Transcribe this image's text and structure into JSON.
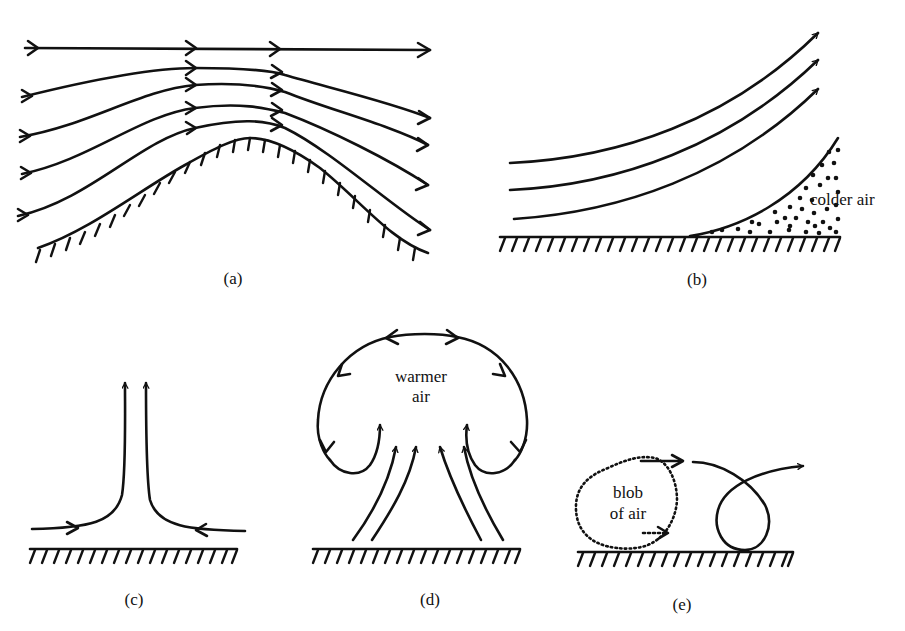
{
  "panels": {
    "a": {
      "caption": "(a)",
      "description": "airflow over a hill"
    },
    "b": {
      "caption": "(b)",
      "label": "colder air",
      "description": "airflow lifted over wedge of colder air"
    },
    "c": {
      "caption": "(c)",
      "description": "converging surface flow rising"
    },
    "d": {
      "caption": "(d)",
      "label_line1": "warmer",
      "label_line2": "air",
      "description": "rising plume of warmer air"
    },
    "e": {
      "caption": "(e)",
      "label_line1": "blob",
      "label_line2": "of air",
      "description": "blob of air rolling along surface"
    }
  },
  "colors": {
    "ink": "#111111",
    "background": "#ffffff"
  }
}
